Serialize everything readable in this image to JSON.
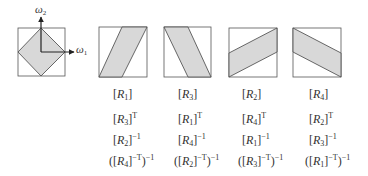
{
  "diagram": {
    "axes": {
      "horizontal": "ω",
      "horizontal_sub": "1",
      "vertical": "ω",
      "vertical_sub": "2"
    },
    "colors": {
      "fill": "#d8d8d8",
      "stroke": "#333333",
      "box": "#555555"
    },
    "reference": {
      "shape": "diamond"
    },
    "panels": [
      {
        "id": "p1",
        "shape": "parallelogram-rising-steep",
        "labels": [
          {
            "base": "[R",
            "sub": "1",
            "close": "]",
            "sup": ""
          },
          {
            "base": "[R",
            "sub": "3",
            "close": "]",
            "sup": "T"
          },
          {
            "base": "[R",
            "sub": "2",
            "close": "]",
            "sup": "−1"
          },
          {
            "base": "([R",
            "sub": "4",
            "close": "]",
            "sup": "−T",
            "tail": ")",
            "tail_sup": "−1"
          }
        ]
      },
      {
        "id": "p2",
        "shape": "parallelogram-falling-steep",
        "labels": [
          {
            "base": "[R",
            "sub": "3",
            "close": "]",
            "sup": ""
          },
          {
            "base": "[R",
            "sub": "1",
            "close": "]",
            "sup": "T"
          },
          {
            "base": "[R",
            "sub": "4",
            "close": "]",
            "sup": "−1"
          },
          {
            "base": "([R",
            "sub": "2",
            "close": "]",
            "sup": "−T",
            "tail": ")",
            "tail_sup": "−1"
          }
        ]
      },
      {
        "id": "p3",
        "shape": "parallelogram-rising-shallow",
        "labels": [
          {
            "base": "[R",
            "sub": "2",
            "close": "]",
            "sup": ""
          },
          {
            "base": "[R",
            "sub": "4",
            "close": "]",
            "sup": "T"
          },
          {
            "base": "[R",
            "sub": "1",
            "close": "]",
            "sup": "−1"
          },
          {
            "base": "([R",
            "sub": "3",
            "close": "]",
            "sup": "−T",
            "tail": ")",
            "tail_sup": "−1"
          }
        ]
      },
      {
        "id": "p4",
        "shape": "parallelogram-falling-shallow",
        "labels": [
          {
            "base": "[R",
            "sub": "4",
            "close": "]",
            "sup": ""
          },
          {
            "base": "[R",
            "sub": "2",
            "close": "]",
            "sup": "T"
          },
          {
            "base": "[R",
            "sub": "3",
            "close": "]",
            "sup": "−1"
          },
          {
            "base": "([R",
            "sub": "1",
            "close": "]",
            "sup": "−T",
            "tail": ")",
            "tail_sup": "−1"
          }
        ]
      }
    ]
  }
}
